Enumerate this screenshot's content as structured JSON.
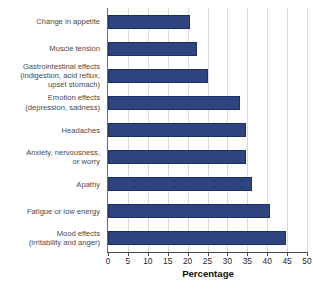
{
  "chart_data": {
    "type": "bar",
    "orientation": "horizontal",
    "title": "",
    "xlabel": "Percentage",
    "ylabel": "",
    "xlim": [
      0,
      50
    ],
    "xticks": [
      "0",
      "5",
      "10",
      "15",
      "20",
      "25",
      "30",
      "35",
      "40",
      "45",
      "50"
    ],
    "xtick_values": [
      0,
      5,
      10,
      15,
      20,
      25,
      30,
      35,
      40,
      45,
      50
    ],
    "grid": "vertical",
    "legend": "none",
    "bar_color": "#2e4480",
    "bar_edge_color": "#1f3060",
    "gridline_color": "#d9d9d9",
    "axis_color": "#4a4a4a",
    "label_color": "#4a4a4a",
    "categories": [
      "Change in appetite",
      "Muscle tension",
      "Gastrointestinal effects\n(indigestion, acid reflux,\nupset stomach)",
      "Emotion effects\n(depression, sadness)",
      "Headaches",
      "Anxiety, nervousness,\nor worry",
      "Apathy",
      "Fatigue or low energy",
      "Mood effects\n(irritability and anger)"
    ],
    "values": [
      20.6,
      22.4,
      25.1,
      33.2,
      34.7,
      34.7,
      36.2,
      40.7,
      44.7
    ]
  }
}
